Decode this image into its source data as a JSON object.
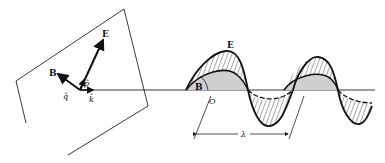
{
  "figure": {
    "plane_panel": {
      "labels": {
        "E": "E",
        "B": "B",
        "p_hat": "p̂",
        "q_hat": "q̂",
        "k_hat": "k̂"
      }
    },
    "wave_panel": {
      "labels": {
        "E": "E",
        "B": "B",
        "origin": "O",
        "wavelength": "λ"
      }
    }
  }
}
